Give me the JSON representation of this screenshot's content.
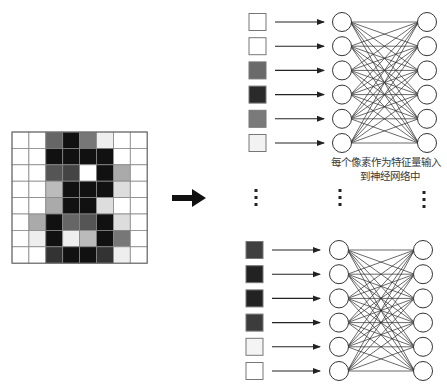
{
  "caption": {
    "line1": "每个像素作为特征量输入",
    "line2": "到神经网络中"
  },
  "pixel_grid": {
    "rows": 8,
    "cols": 8,
    "cells": [
      [
        "#ffffff",
        "#ffffff",
        "#666666",
        "#111111",
        "#777777",
        "#eeeeee",
        "#ffffff",
        "#ffffff"
      ],
      [
        "#ffffff",
        "#ffffff",
        "#111111",
        "#111111",
        "#111111",
        "#111111",
        "#ffffff",
        "#ffffff"
      ],
      [
        "#ffffff",
        "#ffffff",
        "#555555",
        "#444444",
        "#ffffff",
        "#111111",
        "#aaaaaa",
        "#ffffff"
      ],
      [
        "#ffffff",
        "#ffffff",
        "#bbbbbb",
        "#111111",
        "#111111",
        "#111111",
        "#dddddd",
        "#ffffff"
      ],
      [
        "#ffffff",
        "#ffffff",
        "#aaaaaa",
        "#111111",
        "#111111",
        "#dddddd",
        "#ffffff",
        "#ffffff"
      ],
      [
        "#ffffff",
        "#aaaaaa",
        "#111111",
        "#666666",
        "#555555",
        "#111111",
        "#dddddd",
        "#ffffff"
      ],
      [
        "#ffffff",
        "#eeeeee",
        "#111111",
        "#eeeeee",
        "#bbbbbb",
        "#111111",
        "#777777",
        "#ffffff"
      ],
      [
        "#ffffff",
        "#ffffff",
        "#333333",
        "#111111",
        "#111111",
        "#333333",
        "#eeeeee",
        "#ffffff"
      ]
    ]
  },
  "networks": [
    {
      "name": "top",
      "input_pixels": [
        "#ffffff",
        "#ffffff",
        "#6a6a6a",
        "#2a2a2a",
        "#7a7a7a",
        "#f2f2f2"
      ],
      "input_neurons": 6,
      "output_neurons": 6
    },
    {
      "name": "bottom",
      "input_pixels": [
        "#404040",
        "#222222",
        "#222222",
        "#3c3c3c",
        "#f4f4f4",
        "#ffffff"
      ],
      "input_neurons": 6,
      "output_neurons": 6
    }
  ],
  "ellipsis": "⋮",
  "icons": {
    "transform_arrow": "right-arrow-icon",
    "input_arrow": "right-arrow-icon"
  },
  "colors": {
    "stroke": "#222222",
    "grid_line": "#888888",
    "neuron_fill": "#ffffff"
  }
}
